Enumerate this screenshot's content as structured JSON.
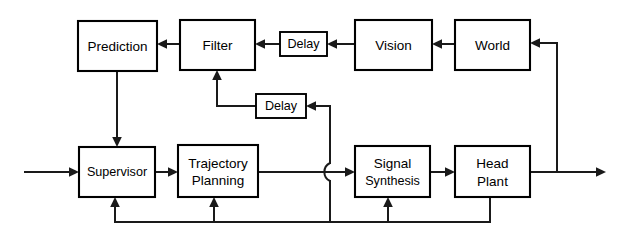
{
  "diagram": {
    "type": "block-diagram",
    "canvas": {
      "width": 629,
      "height": 237
    },
    "colors": {
      "stroke": "#1a1a1a",
      "box_fill": "#ffffff",
      "background": "#ffffff"
    },
    "blocks": [
      {
        "id": "prediction",
        "label": "Prediction",
        "x": 78,
        "y": 21,
        "w": 79,
        "h": 50,
        "lines": [
          "Prediction"
        ]
      },
      {
        "id": "filter",
        "label": "Filter",
        "x": 180,
        "y": 20,
        "w": 75,
        "h": 50,
        "lines": [
          "Filter"
        ]
      },
      {
        "id": "delay-top",
        "label": "Delay",
        "x": 280,
        "y": 32,
        "w": 47,
        "h": 24,
        "lines": [
          "Delay"
        ]
      },
      {
        "id": "vision",
        "label": "Vision",
        "x": 355,
        "y": 20,
        "w": 77,
        "h": 50,
        "lines": [
          "Vision"
        ]
      },
      {
        "id": "world",
        "label": "World",
        "x": 455,
        "y": 20,
        "w": 75,
        "h": 50,
        "lines": [
          "World"
        ]
      },
      {
        "id": "delay-mid",
        "label": "Delay",
        "x": 256,
        "y": 94,
        "w": 50,
        "h": 24,
        "lines": [
          "Delay"
        ]
      },
      {
        "id": "supervisor",
        "label": "Supervisor",
        "x": 79,
        "y": 147,
        "w": 76,
        "h": 50,
        "lines": [
          "Supervisor"
        ]
      },
      {
        "id": "trajectory-planning",
        "label": "Trajectory Planning",
        "x": 178,
        "y": 145,
        "w": 80,
        "h": 52,
        "lines": [
          "Trajectory",
          "Planning"
        ]
      },
      {
        "id": "signal-synthesis",
        "label": "Signal Synthesis",
        "x": 355,
        "y": 146,
        "w": 75,
        "h": 51,
        "lines": [
          "Signal",
          "Synthesis"
        ]
      },
      {
        "id": "head-plant",
        "label": "Head Plant",
        "x": 455,
        "y": 146,
        "w": 75,
        "h": 51,
        "lines": [
          "Head",
          "Plant"
        ]
      }
    ],
    "connections": [
      {
        "id": "input-to-supervisor",
        "from": "external-input",
        "to": "supervisor",
        "arrow": true
      },
      {
        "id": "supervisor-to-trajectory",
        "from": "supervisor",
        "to": "trajectory-planning",
        "arrow": true
      },
      {
        "id": "trajectory-to-signal",
        "from": "trajectory-planning",
        "to": "signal-synthesis",
        "arrow": true
      },
      {
        "id": "signal-to-head-plant",
        "from": "signal-synthesis",
        "to": "head-plant",
        "arrow": true
      },
      {
        "id": "head-plant-to-output",
        "from": "head-plant",
        "to": "external-output",
        "arrow": true
      },
      {
        "id": "head-plant-to-world",
        "from": "head-plant",
        "to": "world",
        "arrow": true
      },
      {
        "id": "world-to-vision",
        "from": "world",
        "to": "vision",
        "arrow": true
      },
      {
        "id": "vision-to-delay-top",
        "from": "vision",
        "to": "delay-top",
        "arrow": true
      },
      {
        "id": "delay-top-to-filter",
        "from": "delay-top",
        "to": "filter",
        "arrow": true
      },
      {
        "id": "filter-to-prediction",
        "from": "filter",
        "to": "prediction",
        "arrow": true
      },
      {
        "id": "prediction-to-supervisor",
        "from": "prediction",
        "to": "supervisor",
        "arrow": true
      },
      {
        "id": "delay-mid-to-filter",
        "from": "delay-mid",
        "to": "filter",
        "arrow": true
      },
      {
        "id": "efference-to-delay-mid",
        "from": "efference-bus",
        "to": "delay-mid",
        "arrow": true
      },
      {
        "id": "feedback-to-supervisor",
        "from": "feedback-bus",
        "to": "supervisor",
        "arrow": true
      },
      {
        "id": "feedback-to-trajectory",
        "from": "feedback-bus",
        "to": "trajectory-planning",
        "arrow": true
      },
      {
        "id": "feedback-to-signal",
        "from": "feedback-bus",
        "to": "signal-synthesis",
        "arrow": true
      }
    ]
  }
}
